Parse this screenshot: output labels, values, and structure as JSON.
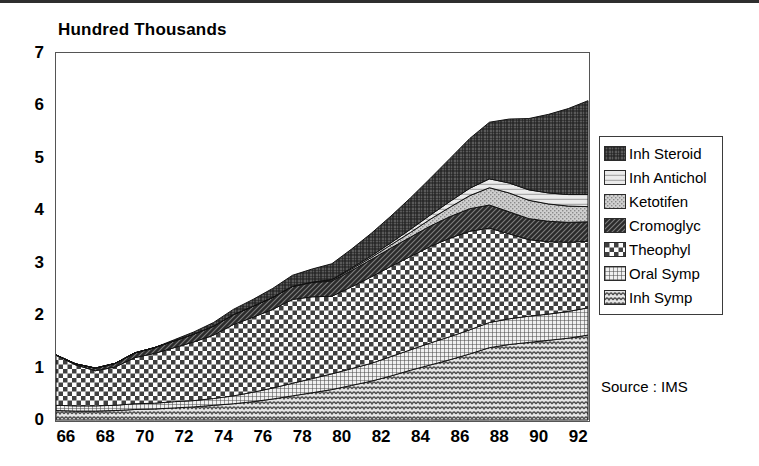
{
  "title": "Hundred Thousands",
  "source": "Source : IMS",
  "axes": {
    "y_ticks": [
      "0",
      "1",
      "2",
      "3",
      "4",
      "5",
      "6",
      "7"
    ],
    "x_ticks": [
      "66",
      "68",
      "70",
      "72",
      "74",
      "76",
      "78",
      "80",
      "82",
      "84",
      "86",
      "88",
      "90",
      "92"
    ]
  },
  "legend": {
    "items": [
      {
        "label": "Inh Steroid",
        "pattern": "dense-crosshatch-dark",
        "color": "#4a4a4a"
      },
      {
        "label": "Inh Antichol",
        "pattern": "horizontal-lines-light",
        "color": "#d9d9d9"
      },
      {
        "label": "Ketotifen",
        "pattern": "fine-dot-light",
        "color": "#bdbdbd"
      },
      {
        "label": "Cromoglyc",
        "pattern": "diagonal-dark",
        "color": "#3a3a3a"
      },
      {
        "label": "Theophyl",
        "pattern": "bold-checker",
        "color": "#707070"
      },
      {
        "label": "Oral Symp",
        "pattern": "fine-grid",
        "color": "#9a9a9a"
      },
      {
        "label": "Inh Symp",
        "pattern": "wave",
        "color": "#a8a8a8"
      }
    ]
  },
  "chart_data": {
    "type": "area",
    "stacked": true,
    "title": "Hundred Thousands",
    "xlabel": "",
    "ylabel": "Hundred Thousands",
    "ylim": [
      0,
      7
    ],
    "xlim": [
      66,
      93
    ],
    "grid": false,
    "legend_position": "right",
    "annotations": [
      "Source : IMS"
    ],
    "x": [
      66,
      67,
      68,
      69,
      70,
      71,
      72,
      73,
      74,
      75,
      76,
      77,
      78,
      79,
      80,
      81,
      82,
      83,
      84,
      85,
      86,
      87,
      88,
      89,
      90,
      91,
      92,
      93
    ],
    "series": [
      {
        "name": "Inh Symp",
        "values": [
          0.18,
          0.17,
          0.17,
          0.18,
          0.2,
          0.21,
          0.23,
          0.25,
          0.28,
          0.31,
          0.35,
          0.4,
          0.46,
          0.52,
          0.58,
          0.66,
          0.74,
          0.84,
          0.95,
          1.05,
          1.15,
          1.26,
          1.38,
          1.44,
          1.48,
          1.52,
          1.56,
          1.62
        ]
      },
      {
        "name": "Oral Symp",
        "values": [
          0.1,
          0.1,
          0.1,
          0.1,
          0.11,
          0.11,
          0.12,
          0.12,
          0.13,
          0.15,
          0.18,
          0.21,
          0.24,
          0.27,
          0.3,
          0.32,
          0.34,
          0.37,
          0.39,
          0.42,
          0.44,
          0.46,
          0.48,
          0.49,
          0.5,
          0.5,
          0.51,
          0.52
        ]
      },
      {
        "name": "Theophyl",
        "values": [
          0.96,
          0.78,
          0.67,
          0.73,
          0.88,
          0.95,
          1.03,
          1.12,
          1.21,
          1.36,
          1.43,
          1.5,
          1.6,
          1.56,
          1.48,
          1.56,
          1.65,
          1.72,
          1.78,
          1.84,
          1.88,
          1.88,
          1.8,
          1.62,
          1.46,
          1.38,
          1.32,
          1.27
        ]
      },
      {
        "name": "Cromoglyc",
        "values": [
          0.0,
          0.02,
          0.05,
          0.07,
          0.09,
          0.11,
          0.13,
          0.15,
          0.17,
          0.19,
          0.21,
          0.23,
          0.25,
          0.27,
          0.29,
          0.31,
          0.33,
          0.35,
          0.37,
          0.39,
          0.41,
          0.43,
          0.44,
          0.42,
          0.4,
          0.39,
          0.38,
          0.37
        ]
      },
      {
        "name": "Ketotifen",
        "values": [
          0.0,
          0.0,
          0.0,
          0.0,
          0.0,
          0.0,
          0.0,
          0.0,
          0.0,
          0.0,
          0.0,
          0.0,
          0.0,
          0.01,
          0.02,
          0.03,
          0.04,
          0.06,
          0.09,
          0.13,
          0.18,
          0.25,
          0.33,
          0.36,
          0.35,
          0.33,
          0.31,
          0.29
        ]
      },
      {
        "name": "Inh Antichol",
        "values": [
          0.0,
          0.0,
          0.0,
          0.0,
          0.0,
          0.0,
          0.0,
          0.0,
          0.0,
          0.0,
          0.0,
          0.0,
          0.0,
          0.0,
          0.01,
          0.02,
          0.03,
          0.04,
          0.06,
          0.08,
          0.11,
          0.14,
          0.17,
          0.19,
          0.2,
          0.21,
          0.22,
          0.23
        ]
      },
      {
        "name": "Inh Steroid",
        "values": [
          0.0,
          0.0,
          0.0,
          0.0,
          0.0,
          0.0,
          0.02,
          0.04,
          0.07,
          0.1,
          0.13,
          0.17,
          0.21,
          0.25,
          0.3,
          0.36,
          0.43,
          0.51,
          0.6,
          0.7,
          0.82,
          0.95,
          1.08,
          1.22,
          1.36,
          1.5,
          1.64,
          1.79
        ]
      }
    ]
  }
}
